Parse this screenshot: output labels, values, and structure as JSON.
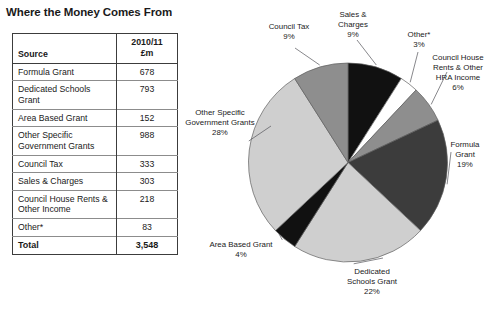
{
  "page_title": "Where the Money Comes From",
  "table": {
    "headers": {
      "source": "Source",
      "amount_year": "2010/11",
      "amount_unit": "£m"
    },
    "rows": [
      {
        "source": "Formula Grant",
        "amount": "678"
      },
      {
        "source": "Dedicated Schools Grant",
        "amount": "793"
      },
      {
        "source": "Area Based Grant",
        "amount": "152"
      },
      {
        "source": "Other Specific Government Grants",
        "amount": "988"
      },
      {
        "source": "Council Tax",
        "amount": "333"
      },
      {
        "source": "Sales & Charges",
        "amount": "303"
      },
      {
        "source": "Council House Rents & Other Income",
        "amount": "218"
      },
      {
        "source": "Other*",
        "amount": "83"
      }
    ],
    "total": {
      "label": "Total",
      "amount": "3,548"
    }
  },
  "chart_data": {
    "type": "pie",
    "title": "Where the Money Comes From",
    "unit": "£m",
    "total": 3548,
    "start_angle_deg": 0,
    "direction": "clockwise",
    "legend": "labels-with-leader-lines",
    "labels": [
      "Sales & Charges\n9%",
      "Other*\n3%",
      "Council House\nRents & Other\nHRA Income\n6%",
      "Formula\nGrant\n19%",
      "Dedicated\nSchools Grant\n22%",
      "Area Based Grant\n4%",
      "Other Specific\nGovernment Grants\n28%",
      "Council Tax\n9%"
    ],
    "slices": [
      {
        "name": "Sales & Charges",
        "value": 303,
        "percent": 9,
        "color": "#111111",
        "label": "Sales &\nCharges\n9%"
      },
      {
        "name": "Other*",
        "value": 83,
        "percent": 3,
        "color": "#ffffff",
        "label": "Other*\n3%"
      },
      {
        "name": "Council House Rents & Other HRA Income",
        "value": 218,
        "percent": 6,
        "color": "#8e8e8e",
        "label": "Council House\nRents & Other\nHRA Income\n6%"
      },
      {
        "name": "Formula Grant",
        "value": 678,
        "percent": 19,
        "color": "#3c3c3c",
        "label": "Formula\nGrant\n19%"
      },
      {
        "name": "Dedicated Schools Grant",
        "value": 793,
        "percent": 22,
        "color": "#cfcfcf",
        "label": "Dedicated\nSchools Grant\n22%"
      },
      {
        "name": "Area Based Grant",
        "value": 152,
        "percent": 4,
        "color": "#111111",
        "label": "Area Based Grant\n4%"
      },
      {
        "name": "Other Specific Government Grants",
        "value": 988,
        "percent": 28,
        "color": "#cfcfcf",
        "label": "Other Specific\nGovernment Grants\n28%"
      },
      {
        "name": "Council Tax",
        "value": 333,
        "percent": 9,
        "color": "#8e8e8e",
        "label": "Council Tax\n9%"
      }
    ]
  },
  "colors": {
    "text": "#1a1a1a",
    "border": "#3c3c3c",
    "rule": "#8c8c8c",
    "black_slice": "#111111",
    "dark_slice": "#3c3c3c",
    "mid_slice": "#8e8e8e",
    "light_slice": "#cfcfcf",
    "white_slice": "#ffffff"
  }
}
